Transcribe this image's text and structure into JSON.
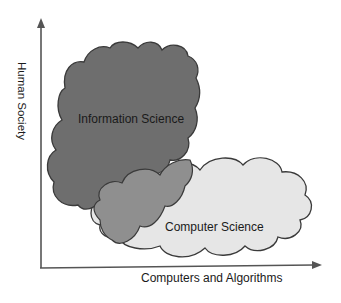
{
  "diagram": {
    "axes": {
      "y_label": "Human Society",
      "x_label": "Computers and Algorithms"
    },
    "regions": [
      {
        "name": "Information Science",
        "fill": "#6e6e6e",
        "stroke": "#3a3a3a"
      },
      {
        "name": "Computer Science",
        "fill": "#e6e6e6",
        "stroke": "#3a3a3a"
      }
    ],
    "overlap_fill": "#8f8f8f",
    "colors": {
      "axis": "#555555",
      "background": "#ffffff",
      "text": "#1a1a1a"
    }
  }
}
